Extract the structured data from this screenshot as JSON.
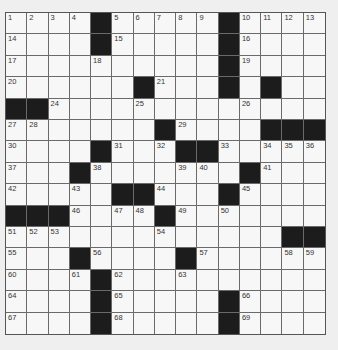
{
  "puzzle": {
    "rows": 15,
    "cols": 15,
    "colors": {
      "background": "#efefef",
      "cell": "#f7f7f7",
      "block": "#1c1c1c",
      "grid_line": "#6a6a6a"
    },
    "grid": [
      "....#.....#....",
      "....#.....#....",
      "..........#....",
      "......#...#.#..",
      "##.............",
      ".......#....###",
      "....#...##.....",
      "...#.......#...",
      ".....##...#....",
      "###....#.......",
      ".............##",
      "...#....#......",
      "....#..........",
      "....#.....#....",
      "....#.....#...."
    ],
    "numbers": [
      {
        "n": "1",
        "r": 0,
        "c": 0
      },
      {
        "n": "2",
        "r": 0,
        "c": 1
      },
      {
        "n": "3",
        "r": 0,
        "c": 2
      },
      {
        "n": "4",
        "r": 0,
        "c": 3
      },
      {
        "n": "5",
        "r": 0,
        "c": 5
      },
      {
        "n": "6",
        "r": 0,
        "c": 6
      },
      {
        "n": "7",
        "r": 0,
        "c": 7
      },
      {
        "n": "8",
        "r": 0,
        "c": 8
      },
      {
        "n": "9",
        "r": 0,
        "c": 9
      },
      {
        "n": "10",
        "r": 0,
        "c": 11
      },
      {
        "n": "11",
        "r": 0,
        "c": 12
      },
      {
        "n": "12",
        "r": 0,
        "c": 13
      },
      {
        "n": "13",
        "r": 0,
        "c": 14
      },
      {
        "n": "14",
        "r": 1,
        "c": 0
      },
      {
        "n": "15",
        "r": 1,
        "c": 5
      },
      {
        "n": "16",
        "r": 1,
        "c": 11
      },
      {
        "n": "17",
        "r": 2,
        "c": 0
      },
      {
        "n": "18",
        "r": 2,
        "c": 4
      },
      {
        "n": "19",
        "r": 2,
        "c": 11
      },
      {
        "n": "20",
        "r": 3,
        "c": 0
      },
      {
        "n": "21",
        "r": 3,
        "c": 7
      },
      {
        "n": "22",
        "r": 3,
        "c": 10
      },
      {
        "n": "23",
        "r": 3,
        "c": 12
      },
      {
        "n": "24",
        "r": 4,
        "c": 2
      },
      {
        "n": "25",
        "r": 4,
        "c": 6
      },
      {
        "n": "26",
        "r": 4,
        "c": 11
      },
      {
        "n": "27",
        "r": 5,
        "c": 0
      },
      {
        "n": "28",
        "r": 5,
        "c": 1
      },
      {
        "n": "29",
        "r": 5,
        "c": 8
      },
      {
        "n": "30",
        "r": 6,
        "c": 0
      },
      {
        "n": "31",
        "r": 6,
        "c": 5
      },
      {
        "n": "32",
        "r": 6,
        "c": 7
      },
      {
        "n": "33",
        "r": 6,
        "c": 10
      },
      {
        "n": "34",
        "r": 6,
        "c": 12
      },
      {
        "n": "35",
        "r": 6,
        "c": 13
      },
      {
        "n": "36",
        "r": 6,
        "c": 14
      },
      {
        "n": "37",
        "r": 7,
        "c": 0
      },
      {
        "n": "38",
        "r": 7,
        "c": 4
      },
      {
        "n": "39",
        "r": 7,
        "c": 8
      },
      {
        "n": "40",
        "r": 7,
        "c": 9
      },
      {
        "n": "41",
        "r": 7,
        "c": 12
      },
      {
        "n": "42",
        "r": 8,
        "c": 0
      },
      {
        "n": "43",
        "r": 8,
        "c": 3
      },
      {
        "n": "44",
        "r": 8,
        "c": 7
      },
      {
        "n": "45",
        "r": 8,
        "c": 11
      },
      {
        "n": "46",
        "r": 9,
        "c": 3
      },
      {
        "n": "47",
        "r": 9,
        "c": 5
      },
      {
        "n": "48",
        "r": 9,
        "c": 6
      },
      {
        "n": "49",
        "r": 9,
        "c": 8
      },
      {
        "n": "50",
        "r": 9,
        "c": 10
      },
      {
        "n": "51",
        "r": 10,
        "c": 0
      },
      {
        "n": "52",
        "r": 10,
        "c": 1
      },
      {
        "n": "53",
        "r": 10,
        "c": 2
      },
      {
        "n": "54",
        "r": 10,
        "c": 7
      },
      {
        "n": "55",
        "r": 11,
        "c": 0
      },
      {
        "n": "56",
        "r": 11,
        "c": 4
      },
      {
        "n": "57",
        "r": 11,
        "c": 9
      },
      {
        "n": "58",
        "r": 11,
        "c": 13
      },
      {
        "n": "59",
        "r": 11,
        "c": 14
      },
      {
        "n": "60",
        "r": 12,
        "c": 0
      },
      {
        "n": "61",
        "r": 12,
        "c": 3
      },
      {
        "n": "62",
        "r": 12,
        "c": 5
      },
      {
        "n": "63",
        "r": 12,
        "c": 8
      },
      {
        "n": "64",
        "r": 13,
        "c": 0
      },
      {
        "n": "65",
        "r": 13,
        "c": 5
      },
      {
        "n": "66",
        "r": 13,
        "c": 11
      },
      {
        "n": "67",
        "r": 14,
        "c": 0
      },
      {
        "n": "68",
        "r": 14,
        "c": 5
      },
      {
        "n": "69",
        "r": 14,
        "c": 11
      }
    ]
  }
}
